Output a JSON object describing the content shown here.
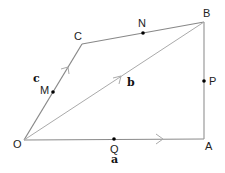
{
  "diagram": {
    "type": "vector-geometry-quadrilateral",
    "colors": {
      "line": "#888888",
      "diagonal": "#aaaaaa",
      "point": "#000000",
      "text": "#222222"
    },
    "vertices": [
      {
        "id": "O",
        "label": "O",
        "x": 24,
        "y": 140,
        "lx": 18,
        "ly": 148
      },
      {
        "id": "A",
        "label": "A",
        "x": 204,
        "y": 139,
        "lx": 209,
        "ly": 148
      },
      {
        "id": "B",
        "label": "B",
        "x": 204,
        "y": 22,
        "lx": 207,
        "ly": 18
      },
      {
        "id": "C",
        "label": "C",
        "x": 82,
        "y": 44,
        "lx": 78,
        "ly": 40
      }
    ],
    "midpoints": [
      {
        "id": "M",
        "label": "M",
        "x": 53,
        "y": 92,
        "lx": 45,
        "ly": 92,
        "on": "OC"
      },
      {
        "id": "N",
        "label": "N",
        "x": 143,
        "y": 33,
        "lx": 143,
        "ly": 26,
        "on": "CB"
      },
      {
        "id": "P",
        "label": "P",
        "x": 204,
        "y": 81,
        "lx": 212,
        "ly": 85,
        "on": "AB"
      },
      {
        "id": "Q",
        "label": "Q",
        "x": 114,
        "y": 139,
        "lx": 114,
        "ly": 152,
        "on": "OA"
      }
    ],
    "vectors": [
      {
        "name": "a",
        "label": "a",
        "from": "O",
        "to": "A",
        "lx": 114,
        "ly": 164
      },
      {
        "name": "b",
        "label": "b",
        "from": "O",
        "to": "B",
        "lx": 130,
        "ly": 85
      },
      {
        "name": "c",
        "label": "c",
        "from": "O",
        "to": "C",
        "lx": 36,
        "ly": 81
      }
    ],
    "segments": [
      "OA",
      "AB",
      "BC",
      "CO",
      "OB"
    ]
  }
}
